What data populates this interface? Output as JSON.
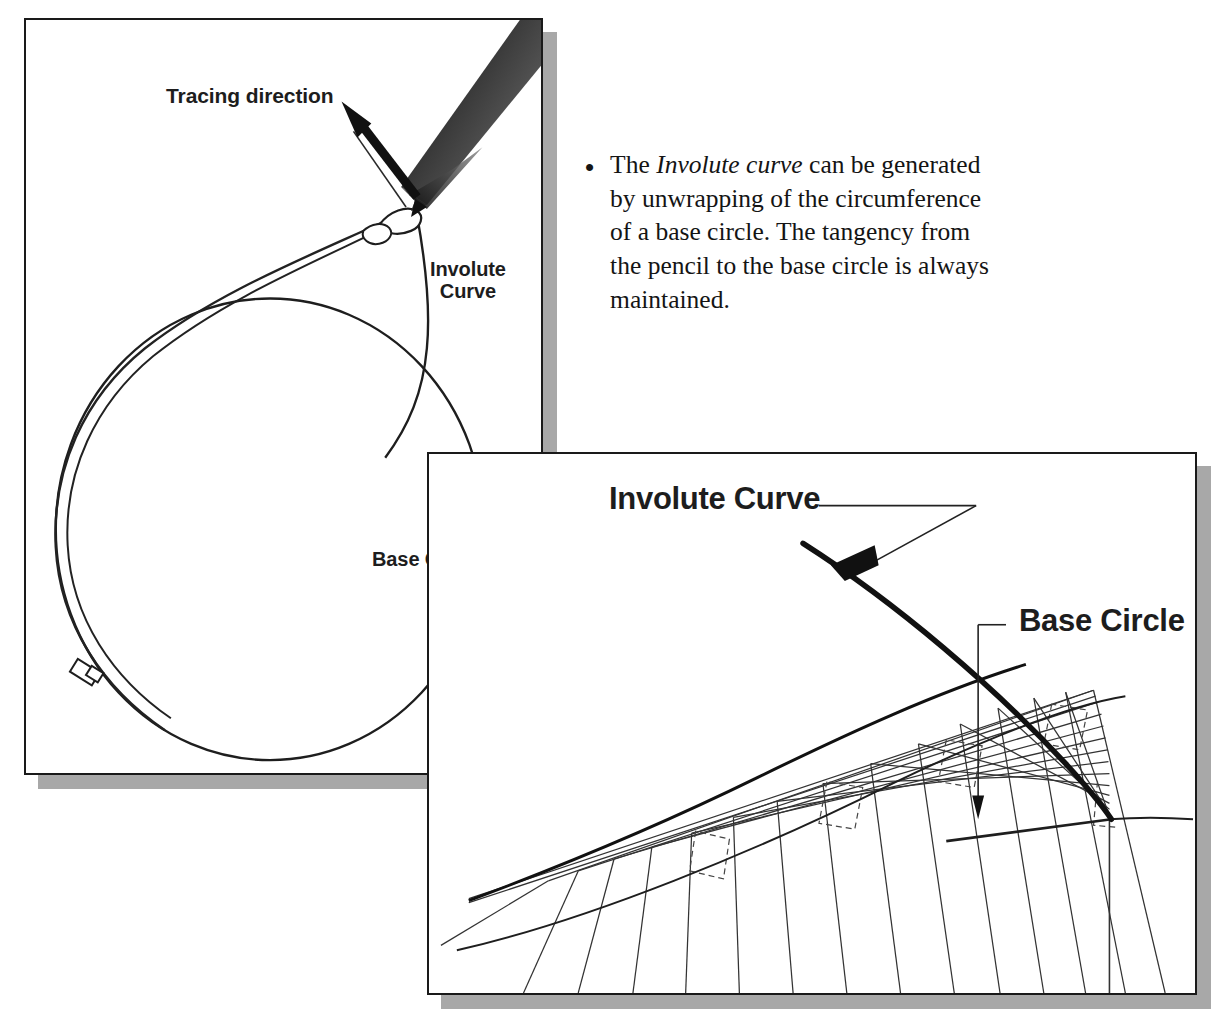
{
  "figure": {
    "colors": {
      "ink": "#1a1a1a",
      "shadow": "#a8a8a8",
      "paper": "#ffffff",
      "pencil_dark": "#3a3a3a",
      "pencil_mid": "#6e6e6e"
    }
  },
  "left_panel": {
    "name": "pencil-and-string-illustration",
    "labels": {
      "tracing_direction": "Tracing direction",
      "involute_curve_line1": "Involute",
      "involute_curve_line2": "Curve",
      "base_circle": "Base Circle"
    },
    "elements": {
      "pencil": "pencil-icon",
      "arrow": "tracing-direction-arrow",
      "string": "string-line",
      "string_clip": "string-clip",
      "circle": "base-circle-outline",
      "involute": "involute-curve-path"
    }
  },
  "right_panel": {
    "name": "involute-construction-diagram",
    "labels": {
      "involute_curve": "Involute Curve",
      "base_circle": "Base Circle"
    },
    "elements": {
      "tangent_fan": "tangent-construction-lines",
      "involute": "involute-curve-path",
      "base_circle_arc": "base-circle-arc",
      "leader_involute": "involute-leader-line",
      "leader_base_circle": "base-circle-leader-line"
    }
  },
  "bullet": {
    "marker": "•",
    "text_part1": "The ",
    "text_italic": "Involute curve",
    "text_part2": " can be generated by unwrapping of the circumference of a base circle. The tangency from the pencil to the base circle is always maintained."
  }
}
